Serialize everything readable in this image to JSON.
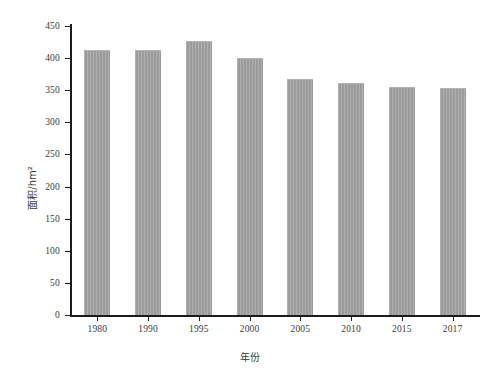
{
  "chart_data": {
    "type": "bar",
    "title": "",
    "xlabel": "年份",
    "ylabel": "面积/hm²",
    "categories": [
      "1980",
      "1990",
      "1995",
      "2000",
      "2005",
      "2010",
      "2015",
      "2017"
    ],
    "values": [
      413,
      413,
      427,
      400,
      368,
      361,
      355,
      353
    ],
    "ylim": [
      0,
      450
    ],
    "ytick_values": [
      0,
      50,
      100,
      150,
      200,
      250,
      300,
      350,
      400,
      450
    ],
    "ytick_labels": [
      "0",
      "50",
      "100",
      "150",
      "200",
      "250",
      "300",
      "350",
      "400",
      "450"
    ],
    "grid": false,
    "legend": null,
    "bar_color": "#a2a2a2",
    "axis_color": "#1c1c1c",
    "text_color": "#3a3a3a",
    "background": "#ffffff"
  }
}
